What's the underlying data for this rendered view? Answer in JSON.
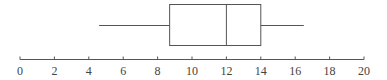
{
  "chart_data": {
    "type": "boxplot",
    "title": "",
    "xlabel": "",
    "ylabel": "",
    "xlim": [
      0,
      20
    ],
    "ticks": [
      0,
      2,
      4,
      6,
      8,
      10,
      12,
      14,
      16,
      18,
      20
    ],
    "tick_labels": [
      "0",
      "2",
      "4",
      "6",
      "8",
      "10",
      "12",
      "14",
      "16",
      "18",
      "20"
    ],
    "grid": false,
    "legend": null,
    "box": {
      "min": 4.6,
      "q1": 8.7,
      "median": 12,
      "q3": 14,
      "max": 16.5
    },
    "orientation": "horizontal"
  },
  "colors": {
    "line": "#555555",
    "text": "#444444",
    "background": "#ffffff"
  }
}
